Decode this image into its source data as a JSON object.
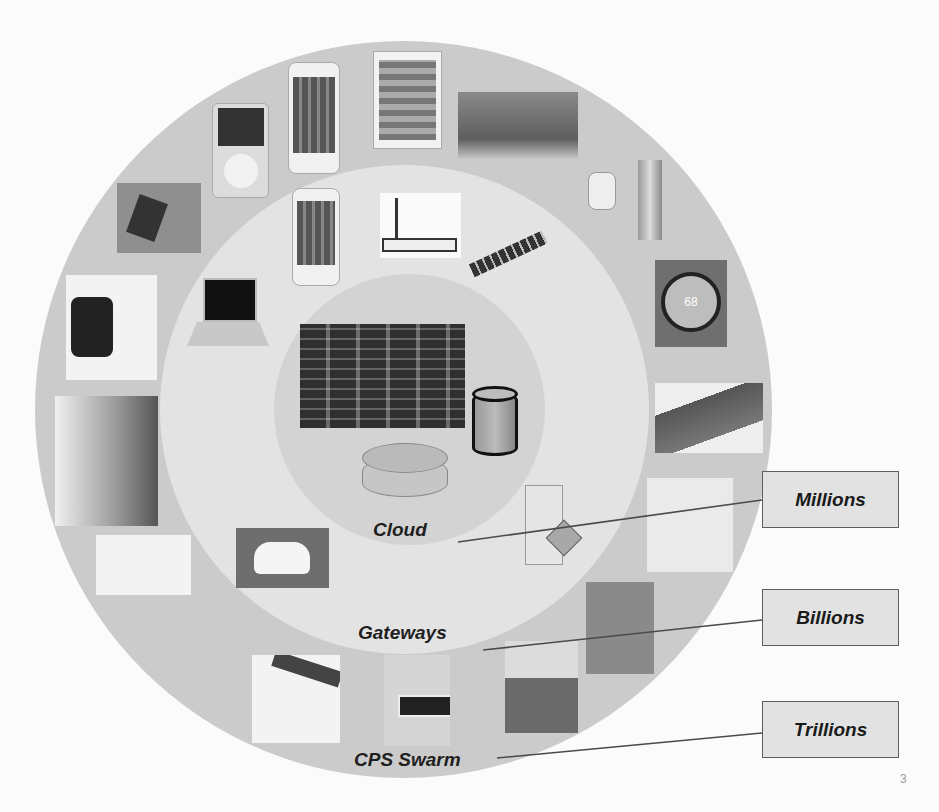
{
  "diagram": {
    "rings": [
      {
        "id": "cloud",
        "label": "Cloud",
        "color": "#d3d3d3"
      },
      {
        "id": "gateways",
        "label": "Gateways",
        "color": "#e3e3e3"
      },
      {
        "id": "cps_swarm",
        "label": "CPS Swarm",
        "color": "#cbcbcb"
      }
    ],
    "scale_labels": [
      {
        "label": "Millions",
        "points_to": "Cloud"
      },
      {
        "label": "Billions",
        "points_to": "Gateways"
      },
      {
        "label": "Trillions",
        "points_to": "CPS Swarm"
      }
    ],
    "cloud_items": [
      "data-center",
      "database-cylinder",
      "router"
    ],
    "gateway_items": [
      "smartphone",
      "wifi-router",
      "satellite",
      "laptop",
      "server-tower",
      "self-driving-car"
    ],
    "cps_items": [
      "ipod",
      "smartphone",
      "tablet",
      "electronic-skin-tattoo",
      "pipe-sensor",
      "nest-thermostat",
      "flexible-display",
      "sensor-vest",
      "ecg-chest-patch",
      "insulin-pump",
      "vr-headset",
      "eeg-headband",
      "prosthetic-legs",
      "google-glass",
      "smartwatch",
      "smart-wristband"
    ],
    "thermostat_reading": "68"
  },
  "page_number": "3"
}
